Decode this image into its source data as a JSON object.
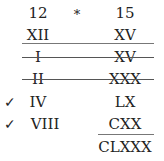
{
  "header": {
    "left": "12",
    "operator": "*",
    "right": "15"
  },
  "rows": [
    {
      "left": "XII",
      "right": "XV",
      "struck": false,
      "checked": false
    },
    {
      "left": "I",
      "right": "XV",
      "struck": true,
      "checked": false
    },
    {
      "left": "II",
      "right": "XXX",
      "struck": true,
      "checked": false
    },
    {
      "left": "IV",
      "right": "LX",
      "struck": false,
      "checked": true
    },
    {
      "left": "VIII",
      "right": "CXX",
      "struck": false,
      "checked": true
    }
  ],
  "result": "CLXXX",
  "check_mark": "✓"
}
